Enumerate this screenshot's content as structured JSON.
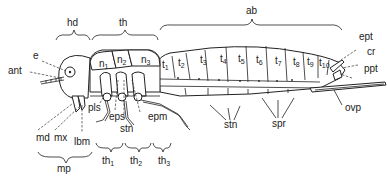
{
  "diagram": {
    "regions": [
      {
        "key": "hd",
        "label": "hd",
        "meaning": "head"
      },
      {
        "key": "th",
        "label": "th",
        "meaning": "thorax"
      },
      {
        "key": "ab",
        "label": "ab",
        "meaning": "abdomen"
      }
    ],
    "head_labels": {
      "e": "e",
      "ant": "ant",
      "md": "md",
      "mx": "mx",
      "lbm": "lbm",
      "mp": "mp"
    },
    "thorax_labels": {
      "pls": "pls",
      "eps": "eps",
      "stn": "stn",
      "epm": "epm",
      "th1": {
        "base": "th",
        "sub": "1"
      },
      "th2": {
        "base": "th",
        "sub": "2"
      },
      "th3": {
        "base": "th",
        "sub": "3"
      }
    },
    "nota": [
      {
        "base": "n",
        "sub": "1"
      },
      {
        "base": "n",
        "sub": "2"
      },
      {
        "base": "n",
        "sub": "3"
      }
    ],
    "terga": [
      {
        "base": "t",
        "sub": "1"
      },
      {
        "base": "t",
        "sub": "2"
      },
      {
        "base": "t",
        "sub": "3"
      },
      {
        "base": "t",
        "sub": "4"
      },
      {
        "base": "t",
        "sub": "5"
      },
      {
        "base": "t",
        "sub": "6"
      },
      {
        "base": "t",
        "sub": "7"
      },
      {
        "base": "t",
        "sub": "8"
      },
      {
        "base": "t",
        "sub": "9"
      },
      {
        "base": "t",
        "sub": "10"
      }
    ],
    "abdomen_labels": {
      "stn": "stn",
      "spr": "spr",
      "ept": "ept",
      "cr": "cr",
      "ppt": "ppt",
      "ovp": "ovp"
    }
  }
}
